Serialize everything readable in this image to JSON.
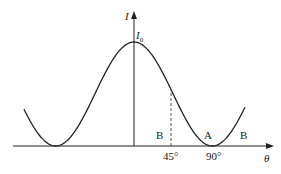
{
  "diagram": {
    "y_axis_label": "I",
    "x_axis_label": "θ",
    "peak_label": "I",
    "peak_subscript": "0",
    "ticks": [
      {
        "label": "45°",
        "x": 171
      },
      {
        "label": "90°",
        "x": 214
      }
    ],
    "region_labels": [
      {
        "label": "B",
        "x": 158,
        "y": 129
      },
      {
        "label": "A",
        "x": 205,
        "y": 129
      },
      {
        "label": "B",
        "x": 240,
        "y": 129
      }
    ],
    "curve": "I = I0·cos²θ",
    "colors": {
      "line": "#222222",
      "dash": "#555555"
    }
  }
}
